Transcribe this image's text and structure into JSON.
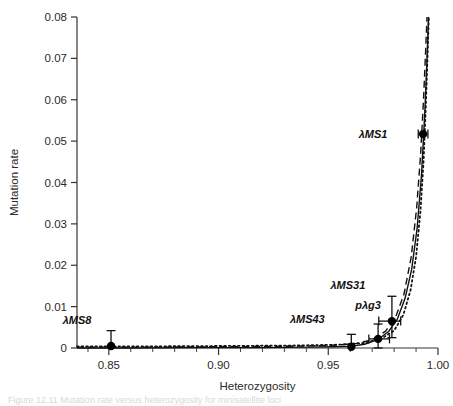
{
  "figure": {
    "caption_fragment": "Figure 12.11  Mutation rate versus heterozygosity for minisatellite loci"
  },
  "chart_data": {
    "type": "scatter",
    "title": "",
    "xlabel": "Heterozygosity",
    "ylabel": "Mutation rate",
    "xlim": [
      0.8355,
      1.0
    ],
    "ylim": [
      0.0,
      0.08
    ],
    "grid": false,
    "legend": "none",
    "x_ticks": [
      {
        "value": 0.85,
        "label": "0.85"
      },
      {
        "value": 0.9,
        "label": "0.90"
      },
      {
        "value": 0.95,
        "label": "0.95"
      },
      {
        "value": 1.0,
        "label": "1.00"
      }
    ],
    "x_minor_ticks": [
      0.8405,
      0.86,
      0.87,
      0.88,
      0.89,
      0.91,
      0.92,
      0.93,
      0.94,
      0.96,
      0.97,
      0.98,
      0.99
    ],
    "y_ticks": [
      {
        "value": 0.0,
        "label": "0"
      },
      {
        "value": 0.01,
        "label": "0.01"
      },
      {
        "value": 0.02,
        "label": "0.02"
      },
      {
        "value": 0.03,
        "label": "0.03"
      },
      {
        "value": 0.04,
        "label": "0.04"
      },
      {
        "value": 0.05,
        "label": "0.05"
      },
      {
        "value": 0.06,
        "label": "0.06"
      },
      {
        "value": 0.07,
        "label": "0.07"
      },
      {
        "value": 0.08,
        "label": "0.08"
      }
    ],
    "points": [
      {
        "name": "λMS8",
        "label": "λMS8",
        "x": 0.851,
        "y": 0.0005,
        "xerr_lo": 0.0,
        "xerr_hi": 0.0,
        "yerr_lo": 0.0005,
        "yerr_hi": 0.0037,
        "label_dx": -34,
        "label_dy": -22
      },
      {
        "name": "λMS43",
        "label": "λMS43",
        "x": 0.9605,
        "y": 0.0003,
        "xerr_lo": 0.0,
        "xerr_hi": 0.0,
        "yerr_lo": 0.0003,
        "yerr_hi": 0.003,
        "label_dx": -44,
        "label_dy": -24
      },
      {
        "name": "pλg3",
        "label": "pλg3",
        "x": 0.9727,
        "y": 0.0022,
        "xerr_lo": 0.0042,
        "xerr_hi": 0.0052,
        "yerr_lo": 0.0022,
        "yerr_hi": 0.0036,
        "label_dx": -10,
        "label_dy": -30
      },
      {
        "name": "λMS31",
        "label": "λMS31",
        "x": 0.979,
        "y": 0.0065,
        "xerr_lo": 0.006,
        "xerr_hi": 0.004,
        "yerr_lo": 0.004,
        "yerr_hi": 0.006,
        "label_dx": -44,
        "label_dy": -32
      },
      {
        "name": "λMS1",
        "label": "λMS1",
        "x": 0.9932,
        "y": 0.0517,
        "xerr_lo": 0.0022,
        "xerr_hi": 0.0022,
        "yerr_lo": 0.0,
        "yerr_hi": 0.0,
        "label_dx": -50,
        "label_dy": 4
      }
    ],
    "series": [
      {
        "name": "solid-curve",
        "style": "solid",
        "x": [
          0.8355,
          0.86,
          0.89,
          0.92,
          0.94,
          0.952,
          0.96,
          0.9665,
          0.9725,
          0.9775,
          0.9815,
          0.985,
          0.988,
          0.9905,
          0.9925,
          0.994,
          0.995,
          0.9957
        ],
        "y": [
          0.0,
          0.0,
          0.0001,
          0.0001,
          0.0002,
          0.0003,
          0.0004,
          0.0009,
          0.002,
          0.004,
          0.007,
          0.012,
          0.019,
          0.029,
          0.042,
          0.057,
          0.07,
          0.08
        ]
      },
      {
        "name": "dashed-curve",
        "style": "dashed",
        "x": [
          0.8355,
          0.87,
          0.9,
          0.93,
          0.95,
          0.962,
          0.97,
          0.976,
          0.9805,
          0.9845,
          0.9878,
          0.9903,
          0.9921,
          0.9934,
          0.9943,
          0.995
        ],
        "y": [
          0.0002,
          0.0002,
          0.0003,
          0.0004,
          0.0006,
          0.001,
          0.002,
          0.004,
          0.0072,
          0.013,
          0.022,
          0.034,
          0.047,
          0.06,
          0.071,
          0.08
        ]
      },
      {
        "name": "dotted-curve",
        "style": "dotted",
        "x": [
          0.8355,
          0.87,
          0.905,
          0.935,
          0.955,
          0.966,
          0.974,
          0.98,
          0.9842,
          0.9875,
          0.99,
          0.992,
          0.9934,
          0.9944,
          0.9952,
          0.9958
        ],
        "y": [
          0.0004,
          0.0004,
          0.0005,
          0.0006,
          0.0008,
          0.0012,
          0.0022,
          0.0042,
          0.008,
          0.014,
          0.022,
          0.033,
          0.045,
          0.058,
          0.07,
          0.08
        ]
      }
    ]
  }
}
